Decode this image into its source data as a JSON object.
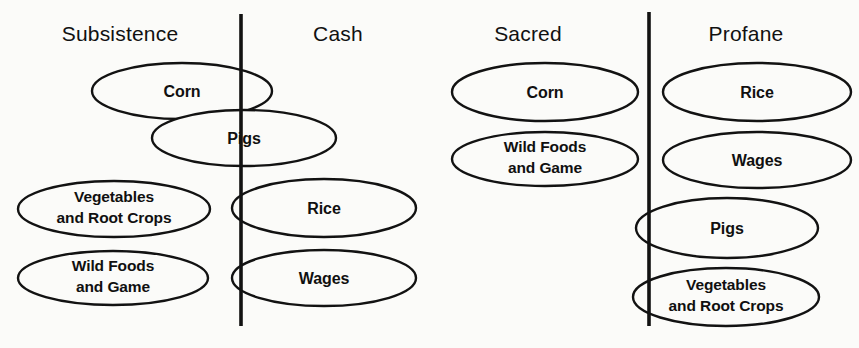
{
  "figure": {
    "background_color": "#fbfbf9",
    "stroke_color": "#121212",
    "panels": [
      {
        "id": "left",
        "left_header": "Subsistence",
        "right_header": "Cash",
        "divider_x": 241,
        "divider_y1": 14,
        "divider_y2": 326,
        "nodes": [
          {
            "id": "corn",
            "label": "Corn",
            "lines": [
              "Corn"
            ],
            "cx": 182,
            "cy": 91,
            "rx": 90,
            "ry": 28
          },
          {
            "id": "pigs",
            "label": "Pigs",
            "lines": [
              "Pigs"
            ],
            "cx": 244,
            "cy": 138,
            "rx": 92,
            "ry": 28
          },
          {
            "id": "vegetables",
            "label": "Vegetables and Root Crops",
            "lines": [
              "Vegetables",
              "and Root Crops"
            ],
            "cx": 114,
            "cy": 209,
            "rx": 96,
            "ry": 28
          },
          {
            "id": "wildfoods",
            "label": "Wild Foods and Game",
            "lines": [
              "Wild Foods",
              "and Game"
            ],
            "cx": 113,
            "cy": 278,
            "rx": 95,
            "ry": 27
          },
          {
            "id": "rice",
            "label": "Rice",
            "lines": [
              "Rice"
            ],
            "cx": 324,
            "cy": 208,
            "rx": 92,
            "ry": 29
          },
          {
            "id": "wages",
            "label": "Wages",
            "lines": [
              "Wages"
            ],
            "cx": 324,
            "cy": 278,
            "rx": 92,
            "ry": 28
          }
        ]
      },
      {
        "id": "right",
        "left_header": "Sacred",
        "right_header": "Profane",
        "divider_x": 649,
        "divider_y1": 12,
        "divider_y2": 326,
        "nodes": [
          {
            "id": "corn",
            "label": "Corn",
            "lines": [
              "Corn"
            ],
            "cx": 545,
            "cy": 92,
            "rx": 93,
            "ry": 29
          },
          {
            "id": "wildfoods",
            "label": "Wild Foods and Game",
            "lines": [
              "Wild Foods",
              "and Game"
            ],
            "cx": 545,
            "cy": 159,
            "rx": 93,
            "ry": 27
          },
          {
            "id": "rice",
            "label": "Rice",
            "lines": [
              "Rice"
            ],
            "cx": 757,
            "cy": 92,
            "rx": 94,
            "ry": 29
          },
          {
            "id": "wages",
            "label": "Wages",
            "lines": [
              "Wages"
            ],
            "cx": 757,
            "cy": 160,
            "rx": 94,
            "ry": 28
          },
          {
            "id": "pigs",
            "label": "Pigs",
            "lines": [
              "Pigs"
            ],
            "cx": 727,
            "cy": 228,
            "rx": 91,
            "ry": 30
          },
          {
            "id": "vegetables",
            "label": "Vegetables and Root Crops",
            "lines": [
              "Vegetables",
              "and Root Crops"
            ],
            "cx": 726,
            "cy": 297,
            "rx": 93,
            "ry": 29
          }
        ]
      }
    ]
  }
}
